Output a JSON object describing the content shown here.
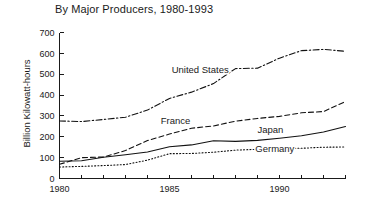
{
  "chart_data": {
    "type": "line",
    "title": "By Major Producers, 1980-1993",
    "xlabel": "",
    "ylabel": "Billion Kilowatt-hours",
    "xlim": [
      1980,
      1993
    ],
    "ylim": [
      0,
      700
    ],
    "grid": false,
    "legend_position": "inline-annotations",
    "x": [
      1980,
      1981,
      1982,
      1983,
      1984,
      1985,
      1986,
      1987,
      1988,
      1989,
      1990,
      1991,
      1992,
      1993
    ],
    "y_ticks": [
      0,
      100,
      200,
      300,
      400,
      500,
      600,
      700
    ],
    "x_ticks": [
      1980,
      1981,
      1982,
      1983,
      1984,
      1985,
      1986,
      1987,
      1988,
      1989,
      1990,
      1991,
      1992,
      1993
    ],
    "x_tick_labels_shown": [
      "1980",
      "1985",
      "1990"
    ],
    "series": [
      {
        "name": "United States",
        "style": "dash-dot",
        "color": "#111111",
        "label_x": 1985.1,
        "label_y": 505,
        "values": [
          276,
          273,
          283,
          294,
          328,
          384,
          414,
          455,
          527,
          529,
          577,
          613,
          619,
          610
        ]
      },
      {
        "name": "France",
        "style": "dashed",
        "color": "#111111",
        "label_x": 1984.6,
        "label_y": 262,
        "values": [
          68,
          100,
          103,
          134,
          182,
          213,
          241,
          252,
          275,
          288,
          298,
          315,
          321,
          369
        ]
      },
      {
        "name": "Japan",
        "style": "solid",
        "color": "#111111",
        "label_x": 1989.0,
        "label_y": 218,
        "values": [
          83,
          85,
          102,
          114,
          127,
          152,
          161,
          181,
          178,
          183,
          193,
          205,
          223,
          249
        ]
      },
      {
        "name": "Germany",
        "style": "dotted",
        "color": "#111111",
        "label_x": 1988.9,
        "label_y": 128,
        "values": [
          55,
          58,
          62,
          67,
          88,
          119,
          120,
          126,
          136,
          140,
          146,
          145,
          150,
          151
        ]
      }
    ]
  }
}
